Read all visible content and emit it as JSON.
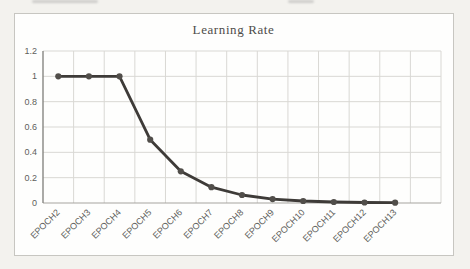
{
  "chart_data": {
    "type": "line",
    "title": "Learning Rate",
    "categories": [
      "EPOCH2",
      "EPOCH3",
      "EPOCH4",
      "EPOCH5",
      "EPOCH6",
      "EPOCH7",
      "EPOCH8",
      "EPOCH9",
      "EPOCH10",
      "EPOCH11",
      "EPOCH12",
      "EPOCH13"
    ],
    "series": [
      {
        "name": "Learning Rate",
        "values": [
          1,
          1,
          1,
          0.5,
          0.25,
          0.125,
          0.063,
          0.031,
          0.016,
          0.008,
          0.004,
          0.002
        ]
      }
    ],
    "xlabel": "",
    "ylabel": "",
    "ylim": [
      0,
      1.2
    ],
    "ytick_interval": 0.2,
    "ytick_labels": [
      "0",
      "0.2",
      "0.4",
      "0.6",
      "0.8",
      "1",
      "1.2"
    ],
    "x_label_rotation_deg": -45,
    "grid": "both",
    "legend": "none",
    "marker": "circle",
    "colors": {
      "line": "#3e3b38",
      "marker": "#514e4a",
      "gridline": "#d9d8d4",
      "x_axis": "#a5a4a0",
      "y_axis": "#878682",
      "tick_label": "#605f5c",
      "title": "#4d4c49",
      "frame_border": "#c7c6c1",
      "chart_background": "#fefefd",
      "page_background": "#f3f2ee"
    }
  }
}
